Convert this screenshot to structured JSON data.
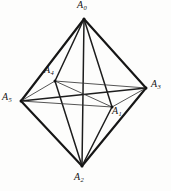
{
  "figure": {
    "canvas": {
      "width": 171,
      "height": 191
    },
    "ink_color": "#161616",
    "background_color": "#fdfdfc",
    "vertices": [
      {
        "id": "A0",
        "letter": "A",
        "subscript": "0",
        "x": 84,
        "y": 19,
        "label_x": 77,
        "label_y": 0,
        "role": "top-apex"
      },
      {
        "id": "A1",
        "letter": "A",
        "subscript": "1",
        "x": 112,
        "y": 107,
        "label_x": 112,
        "label_y": 106,
        "role": "interior-lower-right"
      },
      {
        "id": "A2",
        "letter": "A",
        "subscript": "2",
        "x": 82,
        "y": 166,
        "label_x": 74,
        "label_y": 172,
        "role": "bottom-apex"
      },
      {
        "id": "A3",
        "letter": "A",
        "subscript": "3",
        "x": 146,
        "y": 88,
        "label_x": 151,
        "label_y": 79,
        "role": "right-equator"
      },
      {
        "id": "A4",
        "letter": "A",
        "subscript": "4",
        "x": 55,
        "y": 81,
        "label_x": 44,
        "label_y": 65,
        "role": "interior-upper-left"
      },
      {
        "id": "A5",
        "letter": "A",
        "subscript": "5",
        "x": 21,
        "y": 101,
        "label_x": 2,
        "label_y": 92,
        "role": "left-equator"
      }
    ],
    "edges": [
      {
        "from": "A0",
        "to": "A5",
        "weight": "thick",
        "name": "edge-a0-a5"
      },
      {
        "from": "A0",
        "to": "A3",
        "weight": "thick",
        "name": "edge-a0-a3"
      },
      {
        "from": "A5",
        "to": "A2",
        "weight": "thick",
        "name": "edge-a5-a2"
      },
      {
        "from": "A3",
        "to": "A2",
        "weight": "thick",
        "name": "edge-a3-a2"
      },
      {
        "from": "A0",
        "to": "A2",
        "weight": "medium",
        "name": "edge-a0-a2-vertical-axis"
      },
      {
        "from": "A0",
        "to": "A4",
        "weight": "medium",
        "name": "edge-a0-a4"
      },
      {
        "from": "A0",
        "to": "A1",
        "weight": "medium",
        "name": "edge-a0-a1"
      },
      {
        "from": "A4",
        "to": "A2",
        "weight": "medium",
        "name": "edge-a4-a2"
      },
      {
        "from": "A1",
        "to": "A2",
        "weight": "medium",
        "name": "edge-a1-a2"
      },
      {
        "from": "A5",
        "to": "A3",
        "weight": "medium",
        "name": "edge-a5-a3-horizontal-axis"
      },
      {
        "from": "A5",
        "to": "A4",
        "weight": "thin",
        "name": "edge-a5-a4"
      },
      {
        "from": "A5",
        "to": "A1",
        "weight": "thin",
        "name": "edge-a5-a1"
      },
      {
        "from": "A4",
        "to": "A3",
        "weight": "thin",
        "name": "edge-a4-a3"
      },
      {
        "from": "A1",
        "to": "A3",
        "weight": "thin",
        "name": "edge-a1-a3"
      },
      {
        "from": "A4",
        "to": "A1",
        "weight": "thin",
        "name": "edge-a4-a1"
      }
    ]
  }
}
